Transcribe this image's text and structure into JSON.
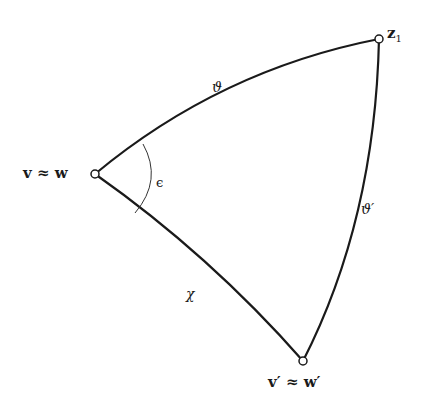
{
  "diagram": {
    "type": "spherical-triangle",
    "stroke_color": "#1a1a1a",
    "background": "#ffffff",
    "vertices": [
      {
        "id": "vw",
        "label": "v ≈ w",
        "x": 95,
        "y": 174
      },
      {
        "id": "z1",
        "label": "z₁",
        "x": 379,
        "y": 39
      },
      {
        "id": "vpwp",
        "label": "v′ ≈ w′",
        "x": 303,
        "y": 361
      }
    ],
    "edges": [
      {
        "from": "vw",
        "to": "z1",
        "label": "ϑ"
      },
      {
        "from": "z1",
        "to": "vpwp",
        "label": "ϑ′"
      },
      {
        "from": "vw",
        "to": "vpwp",
        "label": "χ"
      }
    ],
    "angle": {
      "at": "vw",
      "label": "ϵ"
    }
  },
  "labels": {
    "vertex_vw": "v ≈ w",
    "vertex_z1_main": "z",
    "vertex_z1_sub": "1",
    "vertex_vpwp": "v′ ≈ w′",
    "edge_theta": "ϑ",
    "edge_theta_prime": "ϑ′",
    "edge_chi": "χ",
    "angle_epsilon": "ϵ"
  }
}
